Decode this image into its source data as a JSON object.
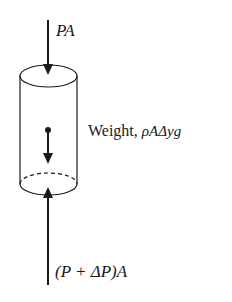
{
  "diagram": {
    "type": "free-body diagram",
    "labels": {
      "top_force": "PA",
      "weight_prefix": "Weight, ",
      "weight_expr": "ρAΔyg",
      "bottom_force": "(P + ΔP)A"
    },
    "colors": {
      "ink": "#1a1a1a",
      "background": "#ffffff"
    }
  }
}
